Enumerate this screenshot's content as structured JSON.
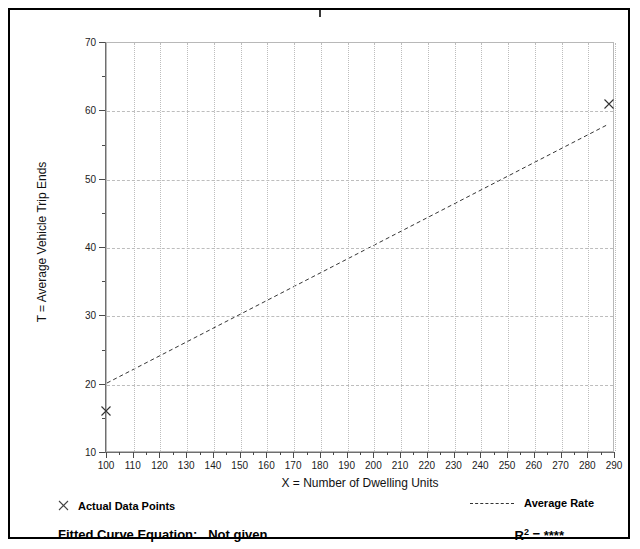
{
  "chart_data": {
    "type": "scatter",
    "title": "",
    "xlabel": "X = Number of Dwelling Units",
    "ylabel": "T = Average Vehicle Trip Ends",
    "xlim": [
      100,
      290
    ],
    "ylim": [
      10,
      70
    ],
    "xticks": [
      100,
      110,
      120,
      130,
      140,
      150,
      160,
      170,
      180,
      190,
      200,
      210,
      220,
      230,
      240,
      250,
      260,
      270,
      280,
      290
    ],
    "yticks": [
      10,
      20,
      30,
      40,
      50,
      60,
      70
    ],
    "x_minor_step": 5,
    "y_minor_step": 5,
    "grid": true,
    "grid_style": "vertical dotted, horizontal dashed",
    "legend_position": "below-plot",
    "series": [
      {
        "name": "Actual Data Points",
        "type": "scatter",
        "marker": "x",
        "points": [
          {
            "x": 100,
            "y": 16
          },
          {
            "x": 288,
            "y": 61
          }
        ]
      },
      {
        "name": "Average Rate",
        "type": "line",
        "style": "dashed",
        "points": [
          {
            "x": 100,
            "y": 20
          },
          {
            "x": 288,
            "y": 58
          }
        ]
      }
    ],
    "annotations": {
      "fitted_curve_equation": "Not given",
      "r_squared": "****"
    }
  },
  "axis": {
    "x_title": "X = Number of Dwelling Units",
    "y_title": "T = Average Vehicle Trip Ends",
    "x_tick_labels": [
      "100",
      "110",
      "120",
      "130",
      "140",
      "150",
      "160",
      "170",
      "180",
      "190",
      "200",
      "210",
      "220",
      "230",
      "240",
      "250",
      "260",
      "270",
      "280",
      "290"
    ],
    "y_tick_labels": [
      "70",
      "60",
      "50",
      "40",
      "30",
      "20",
      "10"
    ]
  },
  "legend": {
    "data_points_label": "Actual Data Points",
    "average_rate_label": "Average Rate",
    "marker_glyph": "x-marker-icon",
    "line_glyph": "dashed-line-icon"
  },
  "footer": {
    "equation_label": "Fitted Curve Equation:",
    "equation_value": "Not given",
    "r2_symbol": "R",
    "r2_exponent": "2",
    "r2_equals": "=",
    "r2_value": "****"
  },
  "colors": {
    "frame": "#000000",
    "grid": "#bdbdbd",
    "axis": "#6f6f6f",
    "text": "#000000",
    "marker": "#333333",
    "trend": "#333333"
  }
}
